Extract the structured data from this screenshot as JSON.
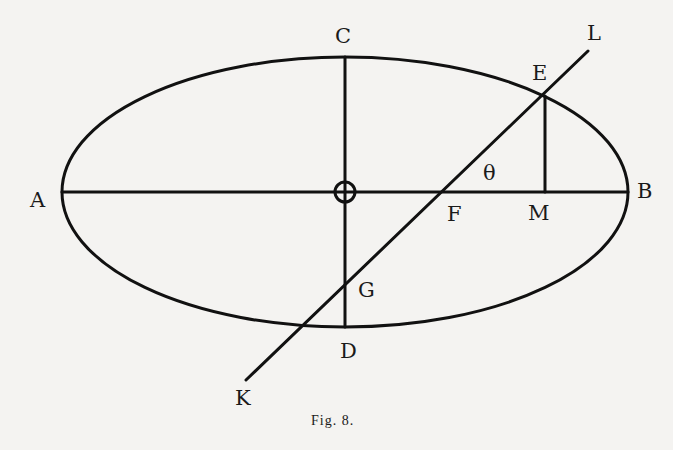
{
  "figure": {
    "caption": "Fig. 8.",
    "labels": {
      "A": "A",
      "B": "B",
      "C": "C",
      "D": "D",
      "E": "E",
      "F": "F",
      "G": "G",
      "K": "K",
      "L": "L",
      "M": "M",
      "O": "O",
      "theta": "θ"
    }
  }
}
